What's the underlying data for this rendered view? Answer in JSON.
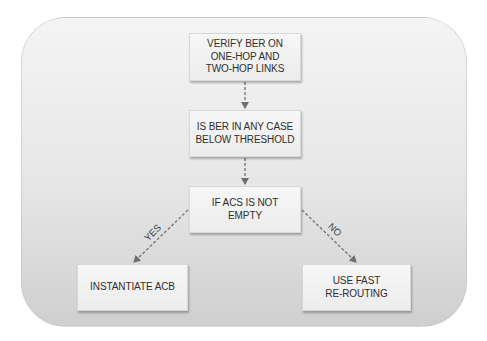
{
  "diagram": {
    "nodes": [
      {
        "id": "verify",
        "label": "VERIFY BER ON\nONE-HOP AND\nTWO-HOP LINKS"
      },
      {
        "id": "check",
        "label": "IS BER IN ANY CASE\nBELOW THRESHOLD"
      },
      {
        "id": "acs",
        "label": "IF ACS IS NOT\nEMPTY"
      },
      {
        "id": "acb",
        "label": "INSTANTIATE ACB"
      },
      {
        "id": "reroute",
        "label": "USE FAST\nRE-ROUTING"
      }
    ],
    "edges": [
      {
        "from": "verify",
        "to": "check",
        "label": ""
      },
      {
        "from": "check",
        "to": "acs",
        "label": ""
      },
      {
        "from": "acs",
        "to": "acb",
        "label": "YES"
      },
      {
        "from": "acs",
        "to": "reroute",
        "label": "NO"
      }
    ],
    "colors": {
      "edge": "#6e6e6e",
      "text": "#2f2f2f"
    }
  }
}
